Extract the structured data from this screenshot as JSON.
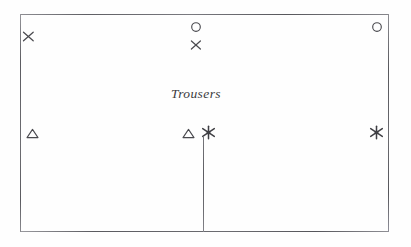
{
  "diagram": {
    "background_color": "#fefefe",
    "line_color": "#6e6e72",
    "ink_color": "#4a4a4f"
  },
  "frame": {
    "name": "pattern-piece-rectangle",
    "edges": {
      "top_label": "top edge",
      "bottom_label": "bottom edge",
      "left_label": "left edge",
      "right_label": "right edge"
    }
  },
  "fold_line": {
    "label": "centre fold line"
  },
  "label": {
    "text": "Trousers"
  },
  "markers": [
    {
      "id": "x-top-left",
      "symbol": "x",
      "name": "notch-x-marker",
      "label": "X",
      "x": 22,
      "y": 30
    },
    {
      "id": "circle-top-center",
      "symbol": "circle",
      "name": "circle-marker",
      "label": "O",
      "x": 190,
      "y": 21
    },
    {
      "id": "x-top-center",
      "symbol": "x",
      "name": "notch-x-marker",
      "label": "X",
      "x": 190,
      "y": 40
    },
    {
      "id": "circle-top-right",
      "symbol": "circle",
      "name": "circle-marker",
      "label": "O",
      "x": 371,
      "y": 21
    },
    {
      "id": "triangle-left",
      "symbol": "triangle",
      "name": "triangle-marker",
      "label": "△",
      "x": 26,
      "y": 128
    },
    {
      "id": "triangle-center",
      "symbol": "triangle",
      "name": "triangle-marker",
      "label": "△",
      "x": 182,
      "y": 128
    },
    {
      "id": "star-center",
      "symbol": "star",
      "name": "asterisk-marker",
      "label": "✳",
      "x": 203,
      "y": 126
    },
    {
      "id": "star-right",
      "symbol": "star",
      "name": "asterisk-marker",
      "label": "✳",
      "x": 371,
      "y": 126
    }
  ]
}
